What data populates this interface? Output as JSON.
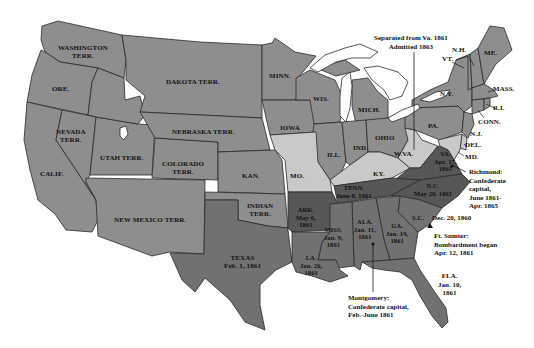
{
  "map": {
    "colors": {
      "water": "#ffffff",
      "union_territory": "#8e8e8e",
      "border_state": "#c9c9c9",
      "confederate_first": "#717171",
      "confederate_second": "#575757",
      "outline": "#2a2a2a"
    },
    "regions": [
      {
        "id": "washington",
        "label": "WASHINGTON\nTERR.",
        "group": "union_territory"
      },
      {
        "id": "oregon",
        "label": "ORE.",
        "group": "union_territory"
      },
      {
        "id": "california",
        "label": "CALIF.",
        "group": "union_territory"
      },
      {
        "id": "nevada",
        "label": "NEVADA\nTERR.",
        "group": "union_territory"
      },
      {
        "id": "utah",
        "label": "UTAH TERR.",
        "group": "union_territory"
      },
      {
        "id": "colorado",
        "label": "COLORADO\nTERR.",
        "group": "union_territory"
      },
      {
        "id": "new_mexico",
        "label": "NEW MEXICO TERR.",
        "group": "union_territory"
      },
      {
        "id": "dakota",
        "label": "DAKOTA TERR.",
        "group": "union_territory"
      },
      {
        "id": "nebraska",
        "label": "NEBRASKA TERR.",
        "group": "union_territory"
      },
      {
        "id": "kansas",
        "label": "KAN.",
        "group": "union_territory"
      },
      {
        "id": "indian",
        "label": "INDIAN\nTERR.",
        "group": "union_territory"
      },
      {
        "id": "minnesota",
        "label": "MINN.",
        "group": "union_territory"
      },
      {
        "id": "iowa",
        "label": "IOWA",
        "group": "union_territory"
      },
      {
        "id": "wisconsin",
        "label": "WIS.",
        "group": "union_territory"
      },
      {
        "id": "illinois",
        "label": "ILL.",
        "group": "union_territory"
      },
      {
        "id": "michigan",
        "label": "MICH.",
        "group": "union_territory"
      },
      {
        "id": "indiana",
        "label": "IND.",
        "group": "union_territory"
      },
      {
        "id": "ohio",
        "label": "OHIO",
        "group": "union_territory"
      },
      {
        "id": "pennsylvania",
        "label": "PA.",
        "group": "union_territory"
      },
      {
        "id": "new_york",
        "label": "N.Y.",
        "group": "union_territory"
      },
      {
        "id": "vermont",
        "label": "VT.",
        "group": "union_territory"
      },
      {
        "id": "new_hampshire",
        "label": "N.H.",
        "group": "union_territory"
      },
      {
        "id": "maine",
        "label": "ME.",
        "group": "union_territory"
      },
      {
        "id": "massachusetts",
        "label": "MASS.",
        "group": "union_territory"
      },
      {
        "id": "rhode_island",
        "label": "R.I.",
        "group": "union_territory"
      },
      {
        "id": "connecticut",
        "label": "CONN.",
        "group": "union_territory"
      },
      {
        "id": "new_jersey",
        "label": "N.J.",
        "group": "union_territory"
      },
      {
        "id": "delaware",
        "label": "DEL.",
        "group": "border_state"
      },
      {
        "id": "maryland",
        "label": "MD.",
        "group": "border_state"
      },
      {
        "id": "missouri",
        "label": "MO.",
        "group": "border_state"
      },
      {
        "id": "kentucky",
        "label": "KY.",
        "group": "border_state"
      },
      {
        "id": "west_virginia",
        "label": "W.VA.",
        "group": "border_state"
      },
      {
        "id": "virginia",
        "label": "VA.\nApr. 17,\n1861",
        "group": "confederate_second"
      },
      {
        "id": "north_carolina",
        "label": "N.C.\nMay 20, 1861",
        "group": "confederate_second"
      },
      {
        "id": "tennessee",
        "label": "TENN.\nJune 8, 1861",
        "group": "confederate_second"
      },
      {
        "id": "arkansas",
        "label": "ARK.\nMay 6,\n1861",
        "group": "confederate_second"
      },
      {
        "id": "south_carolina",
        "label": "S.C.",
        "group": "confederate_first"
      },
      {
        "id": "georgia",
        "label": "GA.\nJan. 19,\n1861",
        "group": "confederate_first"
      },
      {
        "id": "alabama",
        "label": "ALA.\nJan. 11,\n1861",
        "group": "confederate_first"
      },
      {
        "id": "mississippi",
        "label": "MISS.\nJan. 9,\n1861",
        "group": "confederate_first"
      },
      {
        "id": "louisiana",
        "label": "LA.\nJan. 26,\n1861",
        "group": "confederate_first"
      },
      {
        "id": "texas",
        "label": "TEXAS\nFeb. 1, 1861",
        "group": "confederate_first"
      },
      {
        "id": "florida",
        "label": "FLA.\nJan. 10,\n1861",
        "group": "confederate_first"
      }
    ],
    "labels": {
      "washington": "WASHINGTON",
      "washington2": "TERR.",
      "oregon": "ORE.",
      "california": "CALIF.",
      "nevada": "NEVADA",
      "nevada2": "TERR.",
      "utah": "UTAH TERR.",
      "colorado": "COLORADO",
      "colorado2": "TERR.",
      "new_mexico": "NEW MEXICO TERR.",
      "dakota": "DAKOTA TERR.",
      "nebraska": "NEBRASKA TERR.",
      "kansas": "KAN.",
      "indian": "INDIAN",
      "indian2": "TERR.",
      "minnesota": "MINN.",
      "iowa": "IOWA",
      "wisconsin": "WIS.",
      "illinois": "ILL.",
      "michigan": "MICH.",
      "indiana": "IND.",
      "ohio": "OHIO",
      "pennsylvania": "PA.",
      "new_york": "N.Y.",
      "vermont": "VT.",
      "new_hampshire": "N.H.",
      "maine": "ME.",
      "massachusetts": "MASS.",
      "rhode_island": "R.I.",
      "connecticut": "CONN.",
      "new_jersey": "N.J.",
      "delaware": "DEL.",
      "maryland": "MD.",
      "missouri": "MO.",
      "kentucky": "KY.",
      "west_virginia": "W.VA.",
      "virginia": "VA.",
      "virginia_date1": "Apr. 17,",
      "virginia_date2": "1861",
      "north_carolina": "N.C.",
      "north_carolina_date": "May 20, 1861",
      "tennessee": "TENN.",
      "tennessee_date": "June 8, 1861",
      "arkansas": "ARK.",
      "arkansas_date1": "May 6,",
      "arkansas_date2": "1861",
      "south_carolina": "S.C.",
      "south_carolina_date": "Dec. 20, 1860",
      "georgia": "GA.",
      "georgia_date1": "Jan. 19,",
      "georgia_date2": "1861",
      "alabama": "ALA.",
      "alabama_date1": "Jan. 11,",
      "alabama_date2": "1861",
      "mississippi": "MISS.",
      "mississippi_date1": "Jan. 9,",
      "mississippi_date2": "1861",
      "louisiana": "LA.",
      "louisiana_date1": "Jan. 26,",
      "louisiana_date2": "1861",
      "texas": "TEXAS",
      "texas_date": "Feb. 1, 1861",
      "florida": "FLA.",
      "florida_date1": "Jan. 10,",
      "florida_date2": "1861"
    },
    "annotations": {
      "west_virginia_note_1": "Separated from Va. 1861",
      "west_virginia_note_2": "Admitted 1863",
      "richmond_1": "Richmond:",
      "richmond_2": "Confederate",
      "richmond_3": "capital,",
      "richmond_4": "June 1861-",
      "richmond_5": "Apr. 1865",
      "sumter_1": "Ft. Sumter:",
      "sumter_2": "Bombardment began",
      "sumter_3": "Apr. 12, 1861",
      "montgomery_1": "Montgomery:",
      "montgomery_2": "Confederate capital,",
      "montgomery_3": "Feb.-June 1861"
    }
  }
}
